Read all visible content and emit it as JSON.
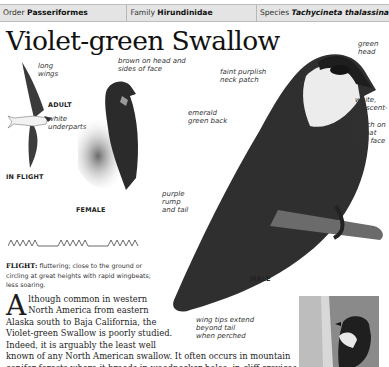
{
  "taxonomy": {
    "order_label": "Order",
    "order_value": "Passeriformes",
    "family_label": "Family",
    "family_value": "Hirundinidae",
    "species_label": "Species",
    "species_value": "Tachycineta thalassina"
  },
  "title": "Violet-green Swallow",
  "illustrations": {
    "in_flight": {
      "caption": "IN FLIGHT",
      "sub_caption": "ADULT",
      "labels": [
        "long wings",
        "white underparts"
      ]
    },
    "female": {
      "caption": "FEMALE",
      "labels": [
        "brown on head and sides of face"
      ]
    },
    "male": {
      "caption": "MALE",
      "labels": [
        "faint purplish neck patch",
        "green head",
        "emerald green back",
        "white, crescent-like patch on throat and face",
        "purple rump and tail",
        "wing tips extend beyond tail when perched"
      ]
    }
  },
  "flight": {
    "label": "FLIGHT:",
    "text": "fluttering; close to the ground or circling at great heights with rapid wingbeats; less soaring."
  },
  "description": {
    "dropcap": "A",
    "lines": [
      "lthough common in western",
      "North America from eastern",
      "Alaska south to Baja California, the",
      "Violet-green Swallow is poorly studied.",
      "Indeed, it is arguably the least well",
      "known of any North American swallow. It often occurs in mountain",
      "conifer forests where it breeds in woodpecker holes, in cliff crevices, and also"
    ]
  }
}
